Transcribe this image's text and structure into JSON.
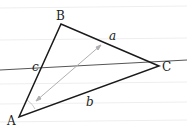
{
  "diagram": {
    "type": "triangle",
    "vertices": {
      "A": {
        "label": "A",
        "x": 19,
        "y": 117
      },
      "B": {
        "label": "B",
        "x": 61,
        "y": 24
      },
      "C": {
        "label": "C",
        "x": 159,
        "y": 66
      }
    },
    "sides": {
      "a": {
        "label": "a"
      },
      "b": {
        "label": "b"
      },
      "c": {
        "label": "c"
      }
    },
    "line": {
      "x1": 0,
      "y1": 70,
      "x2": 187,
      "y2": 60
    },
    "arrow": {
      "x1": 36,
      "y1": 101,
      "x2": 101,
      "y2": 45
    },
    "colors": {
      "triangle": "#1a1a1a",
      "line": "#555555",
      "arrow": "#b0b0b0",
      "ruled": "#eeeeee"
    }
  }
}
